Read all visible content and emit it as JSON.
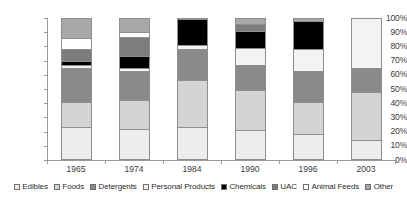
{
  "chart_data": {
    "type": "bar",
    "subtype": "stacked-100-percent",
    "title": "",
    "xlabel": "",
    "ylabel": "",
    "ylim": [
      0,
      100
    ],
    "ytick_labels": [
      "0%",
      "10%",
      "20%",
      "30%",
      "40%",
      "50%",
      "60%",
      "70%",
      "80%",
      "90%",
      "100%"
    ],
    "ytick_values": [
      0,
      10,
      20,
      30,
      40,
      50,
      60,
      70,
      80,
      90,
      100
    ],
    "grid": false,
    "legend_position": "bottom",
    "categories": [
      "1965",
      "1974",
      "1984",
      "1990",
      "1996",
      "2003"
    ],
    "series": [
      {
        "name": "Edibles",
        "color": "#ededed",
        "values": [
          23,
          22,
          23,
          21,
          18,
          14
        ]
      },
      {
        "name": "Foods",
        "color": "#d4d4d4",
        "values": [
          18,
          20,
          33,
          28,
          23,
          34
        ]
      },
      {
        "name": "Detergents",
        "color": "#8a8a8a",
        "values": [
          24,
          21,
          22,
          18,
          22,
          17
        ]
      },
      {
        "name": "Personal Products",
        "color": "#f3f3f3",
        "values": [
          2,
          2,
          3,
          12,
          15,
          35
        ]
      },
      {
        "name": "Chemicals",
        "color": "#000000",
        "values": [
          3,
          8,
          18,
          12,
          20,
          0
        ]
      },
      {
        "name": "UAC",
        "color": "#7d7d7d",
        "values": [
          8,
          14,
          0,
          5,
          0,
          0
        ]
      },
      {
        "name": "Animal Feeds",
        "color": "#ffffff",
        "values": [
          8,
          3,
          0,
          0,
          0,
          0
        ]
      },
      {
        "name": "Other",
        "color": "#a8a8a8",
        "values": [
          14,
          10,
          1,
          4,
          2,
          0
        ]
      }
    ]
  },
  "legend": {
    "items": [
      {
        "label": "Edibles"
      },
      {
        "label": "Foods"
      },
      {
        "label": "Detergents"
      },
      {
        "label": "Personal Products"
      },
      {
        "label": "Chemicals"
      },
      {
        "label": "UAC"
      },
      {
        "label": "Animal Feeds"
      },
      {
        "label": "Other"
      }
    ]
  }
}
